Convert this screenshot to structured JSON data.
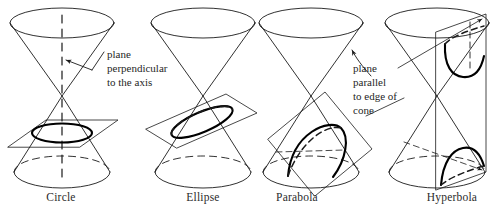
{
  "figure": {
    "background_color": "#ffffff",
    "ink_color": "#1a1a1a",
    "highlight_color": "#000000"
  },
  "panels": [
    {
      "id": "circle",
      "caption": "Circle",
      "plane_shape": "horizontal-parallelogram",
      "cross_section": "circle",
      "axis_shown": true
    },
    {
      "id": "ellipse",
      "caption": "Ellipse",
      "plane_shape": "tilted-rectangle",
      "cross_section": "ellipse",
      "axis_shown": false
    },
    {
      "id": "parabola",
      "caption": "Parabola",
      "plane_shape": "tilted-square",
      "cross_section": "parabola",
      "axis_shown": false
    },
    {
      "id": "hyperbola",
      "caption": "Hyperbola",
      "plane_shape": "vertical-rectangle",
      "cross_section": "hyperbola-two-branches",
      "axis_shown": false
    }
  ],
  "annotations": [
    {
      "id": "plane-perpendicular",
      "lines": [
        "plane",
        "perpendicular",
        "to the axis"
      ],
      "points_to": "cone-axis",
      "leader": "straight-with-arrow"
    },
    {
      "id": "plane-parallel",
      "lines": [
        "plane",
        "parallel",
        "to edge of",
        "cone"
      ],
      "points_to": "cone-edge",
      "leader": "curved-with-arrow"
    }
  ]
}
